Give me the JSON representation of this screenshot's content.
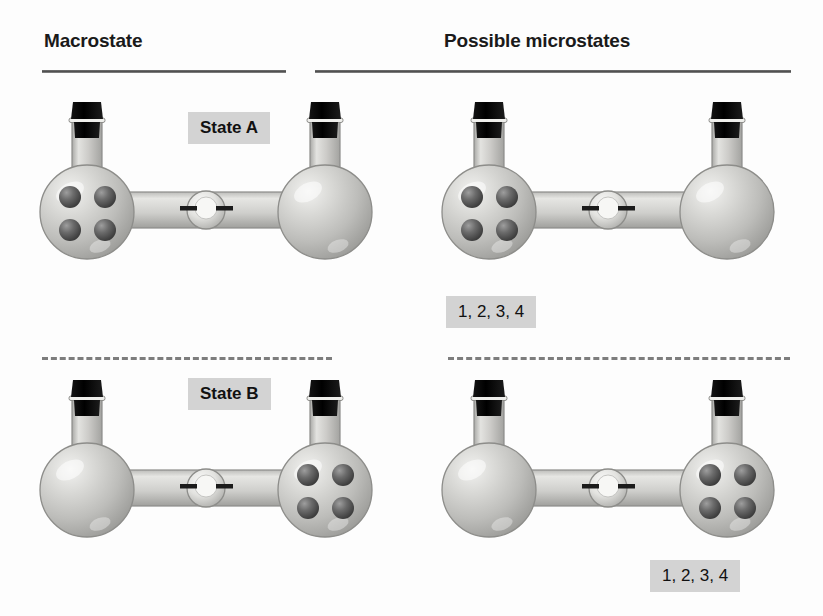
{
  "page": {
    "background_color": "#fdfdfd",
    "width": 823,
    "height": 616
  },
  "columns": {
    "left_header": "Macrostate",
    "right_header": "Possible microstates"
  },
  "colors": {
    "header_text": "#1a1a1a",
    "rule": "#4b4b4b",
    "divider": "#7d7d7d",
    "chip_background": "#d3d3d3",
    "chip_text": "#111111",
    "glass_light": "#e8e8e6",
    "glass_mid": "#c3c3c1",
    "glass_dark": "#9a9a98",
    "glass_outline": "#8a8a88",
    "stopper": "#111111",
    "molecule_dark": "#4a4a4a",
    "molecule_mid": "#6e6e6e",
    "molecule_light": "#9d9d9d"
  },
  "rows": [
    {
      "id": "state-a",
      "macrostate": {
        "label": "State A",
        "left_flask_molecules": 4,
        "right_flask_molecules": 0,
        "valve": "valve-icon",
        "stoppers": 2
      },
      "microstate": {
        "label": "1, 2, 3, 4",
        "left_flask_molecules": 4,
        "right_flask_molecules": 0,
        "valve": "valve-icon",
        "stoppers": 2
      }
    },
    {
      "id": "state-b",
      "macrostate": {
        "label": "State B",
        "left_flask_molecules": 0,
        "right_flask_molecules": 4,
        "valve": "valve-icon",
        "stoppers": 2
      },
      "microstate": {
        "label": "1, 2, 3, 4",
        "left_flask_molecules": 0,
        "right_flask_molecules": 4,
        "valve": "valve-icon",
        "stoppers": 2
      }
    }
  ]
}
